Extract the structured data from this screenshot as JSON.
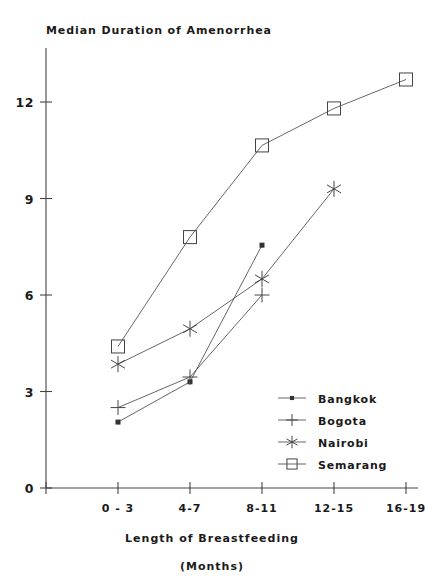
{
  "chart_data": {
    "type": "line",
    "title": "Median Duration of Amenorrhea",
    "xlabel": "Length of Breastfeeding",
    "xlabel_sub": "(Months)",
    "ylabel": "",
    "categories": [
      "0 - 3",
      "4-7",
      "8-11",
      "12-15",
      "16-19"
    ],
    "ytick_labels": [
      "0",
      "3",
      "6",
      "9",
      "12"
    ],
    "yticks": [
      0,
      3,
      6,
      9,
      12
    ],
    "ylim": [
      0,
      13.4
    ],
    "grid": false,
    "legend_position": "inside-lower-right",
    "series": [
      {
        "name": "Bangkok",
        "marker": "filled-square",
        "values": [
          2.05,
          3.3,
          7.55,
          null,
          null
        ]
      },
      {
        "name": "Bogota",
        "marker": "plus",
        "values": [
          2.5,
          3.45,
          6.0,
          null,
          null
        ]
      },
      {
        "name": "Nairobi",
        "marker": "asterisk",
        "values": [
          3.85,
          4.95,
          6.5,
          9.3,
          null
        ]
      },
      {
        "name": "Semarang",
        "marker": "open-square",
        "values": [
          4.4,
          7.8,
          10.65,
          11.8,
          12.7
        ]
      }
    ]
  },
  "legend": {
    "items": [
      {
        "label": "Bangkok"
      },
      {
        "label": "Bogota"
      },
      {
        "label": "Nairobi"
      },
      {
        "label": "Semarang"
      }
    ]
  }
}
